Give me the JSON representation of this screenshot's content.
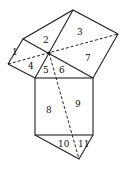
{
  "diagram": {
    "labels": [
      {
        "id": "1",
        "x": 12,
        "y": 55
      },
      {
        "id": "2",
        "x": 43,
        "y": 43
      },
      {
        "id": "3",
        "x": 77,
        "y": 35
      },
      {
        "id": "4",
        "x": 28,
        "y": 69
      },
      {
        "id": "5",
        "x": 43,
        "y": 73
      },
      {
        "id": "6",
        "x": 59,
        "y": 73
      },
      {
        "id": "7",
        "x": 85,
        "y": 61
      },
      {
        "id": "8",
        "x": 46,
        "y": 113
      },
      {
        "id": "9",
        "x": 75,
        "y": 107
      },
      {
        "id": "10",
        "x": 58,
        "y": 147
      },
      {
        "id": "11",
        "x": 78,
        "y": 147
      }
    ]
  }
}
